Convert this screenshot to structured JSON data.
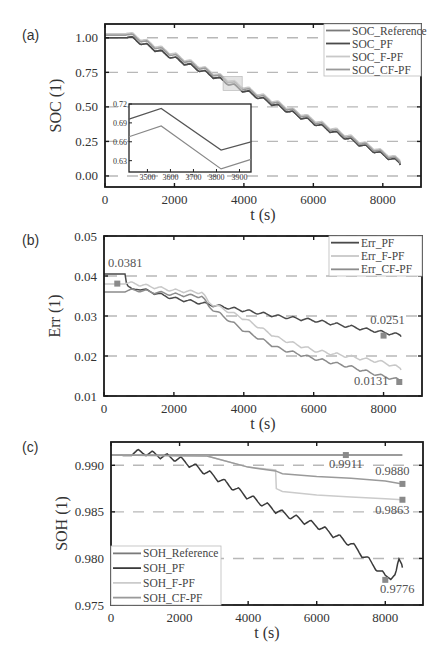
{
  "chart_data": [
    {
      "panel": "(a)",
      "type": "line",
      "title": "",
      "xlabel": "t (s)",
      "ylabel": "SOC (1)",
      "xlim": [
        0,
        9100
      ],
      "ylim": [
        -0.08,
        1.1
      ],
      "xticks": [
        0,
        2000,
        4000,
        6000,
        8000
      ],
      "yticks": [
        0.0,
        0.25,
        0.5,
        0.75,
        1.0
      ],
      "ytick_labels": [
        "0.00",
        "0.25",
        "0.50",
        "0.75",
        "1.00"
      ],
      "grid": "horizontal dashed",
      "legend_position": "upper right",
      "series": [
        {
          "name": "SOC_Reference",
          "color": "#7a7a7a",
          "x": [
            0,
            600,
            8500
          ],
          "y": [
            1.0,
            1.0,
            0.08
          ]
        },
        {
          "name": "SOC_PF",
          "color": "#4a4a4a",
          "x": [
            0,
            600,
            8500
          ],
          "y": [
            1.0,
            1.0,
            0.08
          ]
        },
        {
          "name": "SOC_F-PF",
          "color": "#c8c8c8",
          "x": [
            0,
            600,
            8500
          ],
          "y": [
            1.03,
            1.03,
            0.1
          ]
        },
        {
          "name": "SOC_CF-PF",
          "color": "#9a9a9a",
          "x": [
            0,
            600,
            8500
          ],
          "y": [
            1.02,
            1.02,
            0.09
          ]
        }
      ],
      "inset": {
        "xlim": [
          3420,
          3950
        ],
        "ylim": [
          0.612,
          0.72
        ],
        "xticks": [
          3500,
          3600,
          3700,
          3800,
          3900
        ],
        "yticks": [
          0.63,
          0.66,
          0.69,
          0.72
        ],
        "ytick_labels": [
          "0.63",
          "0.66",
          "0.69",
          "0.72"
        ],
        "zoom_region": {
          "x": [
            3400,
            3950
          ],
          "y": [
            0.62,
            0.72
          ]
        },
        "series": [
          {
            "name": "upper",
            "color": "#555555",
            "x": [
              3420,
              3560,
              3820,
              3950
            ],
            "y": [
              0.696,
              0.713,
              0.647,
              0.66
            ]
          },
          {
            "name": "lower",
            "color": "#888888",
            "x": [
              3420,
              3560,
              3820,
              3950
            ],
            "y": [
              0.668,
              0.685,
              0.617,
              0.632
            ]
          }
        ]
      }
    },
    {
      "panel": "(b)",
      "type": "line",
      "title": "",
      "xlabel": "t (s)",
      "ylabel": "Err (1)",
      "xlim": [
        0,
        9100
      ],
      "ylim": [
        0.01,
        0.05
      ],
      "xticks": [
        0,
        2000,
        4000,
        6000,
        8000
      ],
      "yticks": [
        0.01,
        0.02,
        0.03,
        0.04,
        0.05
      ],
      "ytick_labels": [
        "0.01",
        "0.02",
        "0.03",
        "0.04",
        "0.05"
      ],
      "grid": "horizontal dashed",
      "legend_position": "upper right",
      "series": [
        {
          "name": "Err_PF",
          "color": "#4a4a4a",
          "x": [
            0,
            600,
            650,
            800,
            1000,
            2000,
            3000,
            4000,
            5000,
            6000,
            7000,
            8000,
            8500
          ],
          "y": [
            0.0405,
            0.0405,
            0.0375,
            0.036,
            0.0365,
            0.034,
            0.0325,
            0.031,
            0.0295,
            0.0285,
            0.027,
            0.0255,
            0.0248
          ]
        },
        {
          "name": "Err_F-PF",
          "color": "#c8c8c8",
          "x": [
            0,
            600,
            1000,
            2000,
            2800,
            3000,
            3500,
            4000,
            5000,
            6000,
            7000,
            8000,
            8500
          ],
          "y": [
            0.038,
            0.038,
            0.0375,
            0.036,
            0.0355,
            0.033,
            0.031,
            0.029,
            0.024,
            0.021,
            0.0195,
            0.018,
            0.0165
          ]
        },
        {
          "name": "Err_CF-PF",
          "color": "#8c8c8c",
          "x": [
            0,
            600,
            1000,
            2000,
            2800,
            3000,
            3500,
            4000,
            5000,
            6000,
            7000,
            8000,
            8500
          ],
          "y": [
            0.036,
            0.036,
            0.036,
            0.035,
            0.0345,
            0.032,
            0.029,
            0.026,
            0.0215,
            0.019,
            0.017,
            0.0145,
            0.0135
          ]
        }
      ],
      "annotations": [
        {
          "text": "0.0381",
          "x": 380,
          "y": 0.0381,
          "marker": true
        },
        {
          "text": "0.0251",
          "x": 8000,
          "y": 0.0251,
          "marker": true
        },
        {
          "text": "0.0131",
          "x": 8450,
          "y": 0.0135,
          "marker": true
        }
      ]
    },
    {
      "panel": "(c)",
      "type": "line",
      "title": "",
      "xlabel": "t (s)",
      "ylabel": "SOH (1)",
      "xlim": [
        0,
        9100
      ],
      "ylim": [
        0.975,
        0.9925
      ],
      "xticks": [
        0,
        2000,
        4000,
        6000,
        8000
      ],
      "yticks": [
        0.975,
        0.98,
        0.985,
        0.99
      ],
      "ytick_labels": [
        "0.975",
        "0.980",
        "0.985",
        "0.990"
      ],
      "grid": "horizontal dashed",
      "legend_position": "lower left",
      "series": [
        {
          "name": "SOH_Reference",
          "color": "#7a7a7a",
          "x": [
            0,
            8500
          ],
          "y": [
            0.9911,
            0.9911
          ]
        },
        {
          "name": "SOH_PF",
          "color": "#3a3a3a",
          "x": [
            0,
            1000,
            2000,
            3000,
            4000,
            5000,
            6000,
            7000,
            7500,
            8000,
            8300,
            8400,
            8500
          ],
          "y": [
            0.9911,
            0.991,
            0.9903,
            0.9885,
            0.9863,
            0.9845,
            0.9832,
            0.9812,
            0.9795,
            0.9777,
            0.9778,
            0.9794,
            0.979
          ]
        },
        {
          "name": "SOH_F-PF",
          "color": "#cbcbcb",
          "x": [
            0,
            2800,
            4000,
            4800,
            4820,
            5000,
            6000,
            7000,
            8000,
            8500
          ],
          "y": [
            0.9911,
            0.991,
            0.9898,
            0.9895,
            0.9875,
            0.9872,
            0.9868,
            0.9866,
            0.9864,
            0.9863
          ]
        },
        {
          "name": "SOH_CF-PF",
          "color": "#9a9a9a",
          "x": [
            0,
            2800,
            4000,
            4800,
            5000,
            6000,
            7000,
            8000,
            8500
          ],
          "y": [
            0.9911,
            0.991,
            0.9898,
            0.9894,
            0.9891,
            0.9888,
            0.9886,
            0.9883,
            0.988
          ]
        }
      ],
      "annotations": [
        {
          "text": "0.9911",
          "x": 6850,
          "y": 0.9911,
          "marker": true
        },
        {
          "text": "0.9880",
          "x": 8500,
          "y": 0.988,
          "marker": true
        },
        {
          "text": "0.9863",
          "x": 8500,
          "y": 0.9863,
          "marker": true
        },
        {
          "text": "0.9776",
          "x": 8000,
          "y": 0.9777,
          "marker": true
        }
      ]
    }
  ]
}
